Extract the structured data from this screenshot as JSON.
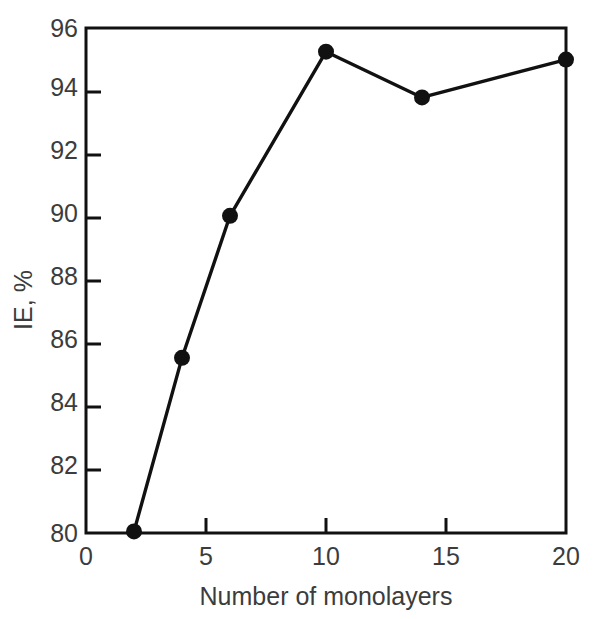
{
  "chart_data": {
    "type": "line",
    "title": "",
    "xlabel": "Number of monolayers",
    "ylabel": "IE, %",
    "xlim": [
      0,
      20
    ],
    "ylim": [
      80,
      96
    ],
    "xticks": [
      0,
      5,
      10,
      15,
      20
    ],
    "yticks": [
      80,
      82,
      84,
      86,
      88,
      90,
      92,
      94,
      96
    ],
    "xtick_labels": [
      "0",
      "5",
      "10",
      "15",
      "20"
    ],
    "ytick_labels": [
      "80",
      "82",
      "84",
      "86",
      "88",
      "90",
      "92",
      "94",
      "96"
    ],
    "grid": false,
    "legend": false,
    "legend_position": "none",
    "marker": "filled-circle",
    "line_color": "#111111",
    "marker_color": "#111111",
    "text_color": "#3c3c3c",
    "background_color": "#ffffff",
    "x": [
      2,
      4,
      6,
      10,
      14,
      20
    ],
    "values": [
      80.05,
      85.55,
      90.05,
      95.25,
      93.8,
      95.0
    ],
    "series": [
      {
        "name": "IE",
        "x": [
          2,
          4,
          6,
          10,
          14,
          20
        ],
        "values": [
          80.05,
          85.55,
          90.05,
          95.25,
          93.8,
          95.0
        ]
      }
    ],
    "points": [
      {
        "x": 2,
        "y": 80.05
      },
      {
        "x": 4,
        "y": 85.55
      },
      {
        "x": 6,
        "y": 90.05
      },
      {
        "x": 10,
        "y": 95.25
      },
      {
        "x": 14,
        "y": 93.8
      },
      {
        "x": 20,
        "y": 95.0
      }
    ]
  },
  "axes": {
    "x_title": "Number of monolayers",
    "y_title": "IE, %"
  }
}
